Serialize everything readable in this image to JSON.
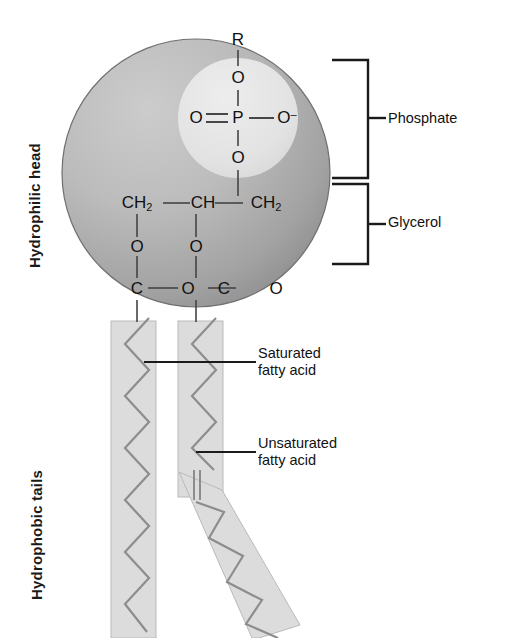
{
  "diagram": {
    "colors": {
      "head_light": "#bdbdbd",
      "head_dark": "#8f8f8f",
      "inner_circle": "#e3e3e3",
      "tail_band": "#dcdcdc",
      "tail_band_stroke": "#b2b2b2",
      "zigzag": "#8a8a8a",
      "line": "#1a1a1a",
      "text": "#111111",
      "background": "#ffffff"
    }
  },
  "side_labels": {
    "hydrophilic_head": "Hydrophilic head",
    "hydrophobic_tails": "Hydrophobic tails"
  },
  "bracket_labels": {
    "phosphate": "Phosphate",
    "glycerol": "Glycerol"
  },
  "callouts": {
    "saturated": {
      "line1": "Saturated",
      "line2": "fatty acid"
    },
    "unsaturated": {
      "line1": "Unsaturated",
      "line2": "fatty acid"
    }
  },
  "chemistry": {
    "phosphate_group": {
      "r_group": "R",
      "ester_oxygen_top": "O",
      "left_oxygen": "O",
      "phosphorus": "P",
      "right_oxygen": "O",
      "right_oxygen_charge": "–",
      "ester_oxygen_bottom": "O"
    },
    "glycerol_backbone": {
      "carbon_1": "CH",
      "carbon_1_sub": "2",
      "carbon_2": "CH",
      "carbon_3": "CH",
      "carbon_3_sub": "2",
      "ester_oxygen_left": "O",
      "ester_oxygen_middle": "O",
      "carbonyl_carbon_left": "C",
      "carbonyl_oxygen_left": "O",
      "carbonyl_carbon_right": "C",
      "carbonyl_oxygen_right": "O"
    }
  }
}
